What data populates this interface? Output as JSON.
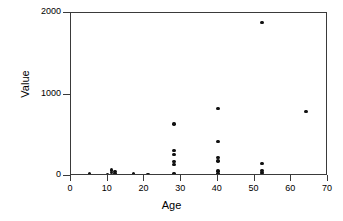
{
  "chart_data": {
    "type": "scatter",
    "title": "",
    "xlabel": "Age",
    "ylabel": "Value",
    "xlim": [
      0,
      70
    ],
    "ylim": [
      0,
      2000
    ],
    "xticks": [
      0,
      10,
      20,
      30,
      40,
      50,
      60,
      70
    ],
    "yticks": [
      0,
      1000,
      2000
    ],
    "xtick_labels": [
      "0",
      "10",
      "20",
      "30",
      "40",
      "50",
      "60",
      "70"
    ],
    "ytick_labels": [
      "0",
      "1000",
      "2000"
    ],
    "grid": false,
    "legend": false,
    "marker": "filled-circle",
    "marker_color": "#111111",
    "frame_color": "#3a3a3a",
    "background": "#ffffff",
    "points": [
      {
        "x": 5,
        "y": 25
      },
      {
        "x": 10,
        "y": 20
      },
      {
        "x": 11,
        "y": 40
      },
      {
        "x": 11,
        "y": 75
      },
      {
        "x": 12,
        "y": 30
      },
      {
        "x": 12,
        "y": 55
      },
      {
        "x": 17,
        "y": 25
      },
      {
        "x": 21,
        "y": 15
      },
      {
        "x": 28,
        "y": 640
      },
      {
        "x": 28,
        "y": 310
      },
      {
        "x": 28,
        "y": 265
      },
      {
        "x": 28,
        "y": 175
      },
      {
        "x": 28,
        "y": 140
      },
      {
        "x": 28,
        "y": 30
      },
      {
        "x": 40,
        "y": 825
      },
      {
        "x": 40,
        "y": 420
      },
      {
        "x": 40,
        "y": 225
      },
      {
        "x": 40,
        "y": 185
      },
      {
        "x": 40,
        "y": 60
      },
      {
        "x": 40,
        "y": 30
      },
      {
        "x": 52,
        "y": 1880
      },
      {
        "x": 52,
        "y": 150
      },
      {
        "x": 52,
        "y": 70
      },
      {
        "x": 52,
        "y": 45
      },
      {
        "x": 52,
        "y": 20
      },
      {
        "x": 64,
        "y": 790
      }
    ]
  },
  "axes": {
    "x_title": "Age",
    "y_title": "Value"
  }
}
